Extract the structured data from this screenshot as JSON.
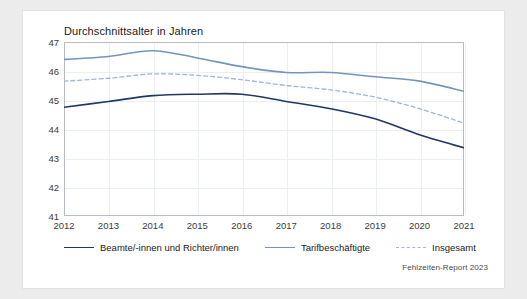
{
  "chart_data": {
    "type": "line",
    "title": "Durchschnittsalter in Jahren",
    "xlabel": "",
    "ylabel": "",
    "ylim": [
      41,
      47
    ],
    "yticks": [
      41,
      42,
      43,
      44,
      45,
      46,
      47
    ],
    "grid": true,
    "legend_position": "bottom",
    "categories": [
      "2012",
      "2013",
      "2014",
      "2015",
      "2016",
      "2017",
      "2018",
      "2019",
      "2020",
      "2021"
    ],
    "series": [
      {
        "name": "Beamte/-innen und Richter/innen",
        "style": "solid",
        "color": "#1f3864",
        "values": [
          44.75,
          44.95,
          45.15,
          45.2,
          45.2,
          44.95,
          44.7,
          44.35,
          43.8,
          43.35
        ]
      },
      {
        "name": "Tarifbeschäftigte",
        "style": "solid",
        "color": "#7395bd",
        "values": [
          46.4,
          46.5,
          46.7,
          46.45,
          46.15,
          45.95,
          45.95,
          45.8,
          45.65,
          45.3
        ]
      },
      {
        "name": "Insgesamt",
        "style": "dashed",
        "color": "#9fb6d4",
        "values": [
          45.65,
          45.75,
          45.9,
          45.85,
          45.7,
          45.5,
          45.35,
          45.1,
          44.7,
          44.2
        ]
      }
    ]
  },
  "source": {
    "text": "Fehlzeiten-Report 2023"
  },
  "colors": {
    "accent_dark": "#1f3864",
    "accent_mid": "#7395bd",
    "accent_light": "#9fb6d4",
    "grid": "#eceff2",
    "frame": "#b9bcc0",
    "page_bg": "#ececed",
    "card_bg": "#ffffff"
  }
}
